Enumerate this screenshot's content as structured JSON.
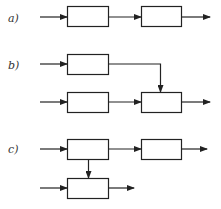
{
  "labels": {
    "a": "a)",
    "b": "b)",
    "c": "c)"
  },
  "colors": {
    "stroke": "#222222",
    "background": "#ffffff"
  },
  "diagrams": [
    {
      "id": "a",
      "description": "two blocks in series",
      "blocks": 2
    },
    {
      "id": "b",
      "description": "two parallel blocks merging into a third block",
      "blocks": 3
    },
    {
      "id": "c",
      "description": "block feeding a following block and a branch block below",
      "blocks": 3
    }
  ]
}
